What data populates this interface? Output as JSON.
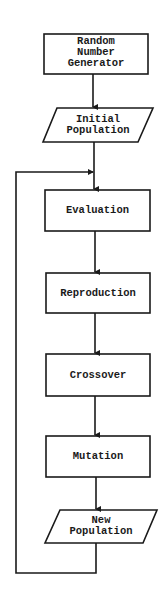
{
  "diagram": {
    "type": "flowchart",
    "stroke_color": "#1a1a1a",
    "nodes": [
      {
        "id": "rng",
        "shape": "rectangle",
        "lines": [
          "Random",
          "Number",
          "Generator"
        ]
      },
      {
        "id": "initial",
        "shape": "parallelogram",
        "lines": [
          "Initial",
          "Population"
        ]
      },
      {
        "id": "evaluation",
        "shape": "rectangle",
        "lines": [
          "Evaluation"
        ]
      },
      {
        "id": "reproduction",
        "shape": "rectangle",
        "lines": [
          "Reproduction"
        ]
      },
      {
        "id": "crossover",
        "shape": "rectangle",
        "lines": [
          "Crossover"
        ]
      },
      {
        "id": "mutation",
        "shape": "rectangle",
        "lines": [
          "Mutation"
        ]
      },
      {
        "id": "new",
        "shape": "parallelogram",
        "lines": [
          "New",
          "Population"
        ]
      }
    ],
    "edges": [
      {
        "from": "rng",
        "to": "initial"
      },
      {
        "from": "initial",
        "to": "evaluation"
      },
      {
        "from": "evaluation",
        "to": "reproduction"
      },
      {
        "from": "reproduction",
        "to": "crossover"
      },
      {
        "from": "crossover",
        "to": "mutation"
      },
      {
        "from": "mutation",
        "to": "new"
      },
      {
        "from": "new",
        "to": "evaluation",
        "type": "loop-back"
      }
    ]
  }
}
